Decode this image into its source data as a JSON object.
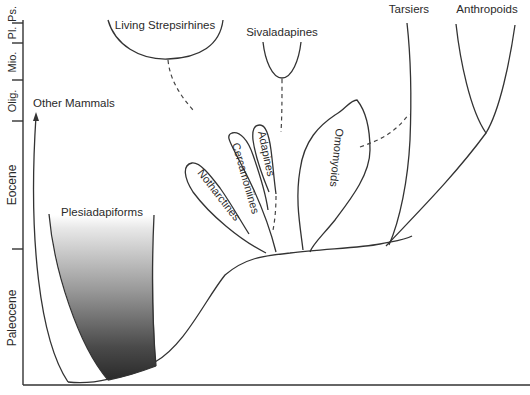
{
  "axis": {
    "epochs": [
      {
        "label": "Paleocene"
      },
      {
        "label": "Eocene"
      },
      {
        "label": "Olig."
      },
      {
        "label": "Mio."
      },
      {
        "label": "Pl."
      },
      {
        "label": "Ps."
      }
    ]
  },
  "clades": {
    "other_mammals": "Other Mammals",
    "plesiadapiforms": "Plesiadapiforms",
    "living_strepsirhines": "Living Strepsirhines",
    "sivaladapines": "Sivaladapines",
    "notharctines": "Notharctines",
    "cercamoniines": "Cercamoniines",
    "adapines": "Adapines",
    "omomyoids": "Omomyoids",
    "tarsiers": "Tarsiers",
    "anthropoids": "Anthropoids"
  },
  "colors": {
    "line": "#333333",
    "shade_dark": "#2a2a2a",
    "shade_light": "#ffffff"
  }
}
